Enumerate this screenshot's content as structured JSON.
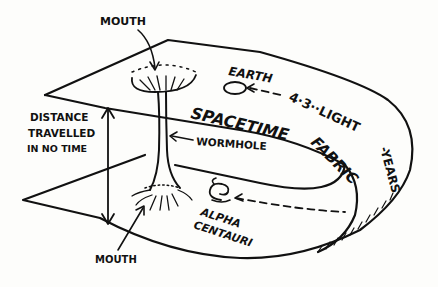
{
  "diagram": {
    "labels": {
      "mouth_top": "MOUTH",
      "mouth_bottom": "MOUTH",
      "earth": "EARTH",
      "distance_line1": "DISTANCE",
      "distance_line2": "TRAVELLED",
      "distance_line3": "IN NO TIME",
      "spacetime_fabric_1": "SPACETIME",
      "spacetime_fabric_2": "FABRIC",
      "wormhole": "WORMHOLE",
      "alpha": "ALPHA",
      "centauri": "CENTAURI",
      "light_years_1": "4·3··LIGHT",
      "light_years_2": "-YEARS"
    },
    "nodes": [
      {
        "id": "earth",
        "label": "EARTH",
        "shape": "ellipse"
      },
      {
        "id": "alpha-centauri",
        "label": "ALPHA CENTAURI",
        "shape": "spiral"
      },
      {
        "id": "mouth-top",
        "label": "MOUTH",
        "shape": "funnel"
      },
      {
        "id": "mouth-bottom",
        "label": "MOUTH",
        "shape": "funnel"
      },
      {
        "id": "wormhole",
        "label": "WORMHOLE",
        "shape": "tube"
      }
    ],
    "edges": [
      {
        "from": "alpha-centauri",
        "to": "earth",
        "label": "4.3 LIGHT-YEARS",
        "style": "dashed",
        "path": "around folded spacetime fabric"
      },
      {
        "from": "mouth-bottom",
        "to": "mouth-top",
        "label": "DISTANCE TRAVELLED IN NO TIME",
        "style": "double-arrow"
      }
    ],
    "colors": {
      "ink": "#111111",
      "paper": "#fdfdfb"
    }
  }
}
